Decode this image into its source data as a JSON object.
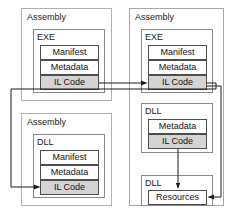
{
  "diagram": {
    "colors": {
      "background": "#ffffff",
      "panel_border": "#a8a8a8",
      "assembly_border": "#b0b0b0",
      "module_border": "#888888",
      "section_border": "#4d4d4d",
      "section_shaded_fill": "#d4d4d4",
      "section_plain_fill": "#ffffff",
      "edge_stroke": "#1a1a1a",
      "text": "#111111"
    },
    "labels": {
      "assembly": "Assembly",
      "exe": "EXE",
      "dll": "DLL",
      "manifest": "Manifest",
      "metadata": "Metadata",
      "il_code": "IL Code",
      "resources": "Resources"
    },
    "left_group": {
      "assembly_exe": {
        "container_label": "Assembly",
        "module_label": "EXE",
        "sections": [
          {
            "label": "Manifest",
            "shaded": false
          },
          {
            "label": "Metadata",
            "shaded": false
          },
          {
            "label": "IL Code",
            "shaded": true
          }
        ]
      },
      "assembly_dll": {
        "container_label": "Assembly",
        "module_label": "DLL",
        "sections": [
          {
            "label": "Manifest",
            "shaded": false
          },
          {
            "label": "Metadata",
            "shaded": false
          },
          {
            "label": "IL Code",
            "shaded": true
          }
        ]
      }
    },
    "right_group": {
      "container_label": "Assembly",
      "module_exe": {
        "module_label": "EXE",
        "sections": [
          {
            "label": "Manifest",
            "shaded": false
          },
          {
            "label": "Metadata",
            "shaded": false
          },
          {
            "label": "IL Code",
            "shaded": true
          }
        ]
      },
      "module_dll_code": {
        "module_label": "DLL",
        "sections": [
          {
            "label": "Metadata",
            "shaded": false
          },
          {
            "label": "IL Code",
            "shaded": true
          }
        ]
      },
      "module_dll_resources": {
        "module_label": "DLL",
        "sections": [
          {
            "label": "Resources",
            "shaded": false
          }
        ]
      }
    },
    "edges": [
      {
        "name": "left-exe-il-to-right-exe-il",
        "from": "left EXE IL Code",
        "to": "right EXE IL Code",
        "arrow": true
      },
      {
        "name": "right-exe-il-to-left-dll-il",
        "from": "right EXE IL Code",
        "to": "left DLL IL Code",
        "arrow": true
      },
      {
        "name": "right-dll-il-to-resources",
        "from": "right DLL IL Code",
        "to": "right DLL Resources",
        "arrow": true
      },
      {
        "name": "right-exe-il-to-resources",
        "from": "right EXE IL Code",
        "to": "right DLL Resources",
        "arrow": true
      }
    ]
  }
}
